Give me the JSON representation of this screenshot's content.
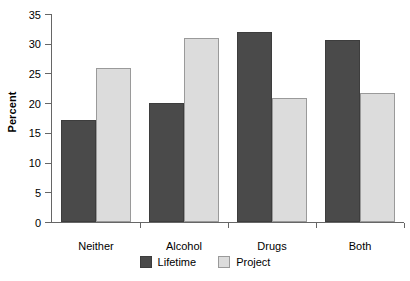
{
  "chart_data": {
    "type": "bar",
    "title": "",
    "xlabel": "",
    "ylabel": "Percent",
    "ylim": [
      0,
      35
    ],
    "yticks": [
      0,
      5,
      10,
      15,
      20,
      25,
      30,
      35
    ],
    "ytick_labels": [
      "0",
      "5",
      "10",
      "15",
      "20",
      "25",
      "30",
      "35"
    ],
    "grid": false,
    "legend_position": "bottom-center",
    "categories": [
      "Neither",
      "Alcohol",
      "Drugs",
      "Both"
    ],
    "series": [
      {
        "name": "Lifetime",
        "color": "#4a4a4a",
        "values": [
          17.2,
          20.0,
          32.0,
          30.7
        ]
      },
      {
        "name": "Project",
        "color": "#dcdcdc",
        "values": [
          26.0,
          31.0,
          20.9,
          21.7
        ]
      }
    ]
  },
  "axis": {
    "line_color": "#666666"
  }
}
